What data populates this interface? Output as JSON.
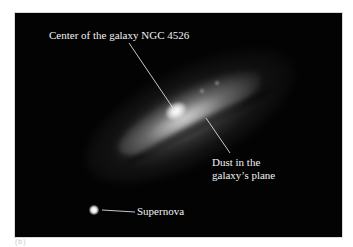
{
  "figure": {
    "background_color": "#030303",
    "label_color": "#f2f2f2",
    "annotations": [
      {
        "id": "center",
        "text": "Center of the galaxy NGC 4526"
      },
      {
        "id": "dust_line1",
        "text": "Dust in the"
      },
      {
        "id": "dust_line2",
        "text": "galaxy’s plane"
      },
      {
        "id": "supernova",
        "text": "Supernova"
      }
    ],
    "panel_tag": "(b)"
  }
}
